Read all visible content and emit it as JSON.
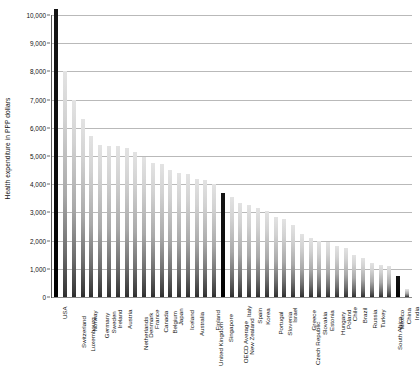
{
  "chart_data": {
    "type": "bar",
    "title": "",
    "subtitle": "",
    "xlabel": "",
    "ylabel": "Health expenditure in PPP dollars",
    "ylim": [
      0,
      10000
    ],
    "ytick_labels": [
      "10,000",
      "9,000",
      "8,000",
      "7,000",
      "6,000",
      "5,000",
      "4,000",
      "3,000",
      "2,000",
      "1,000",
      "0"
    ],
    "ytick_values": [
      10000,
      9000,
      8000,
      7000,
      6000,
      5000,
      4000,
      3000,
      2000,
      1000,
      0
    ],
    "grid": true,
    "legend": "none",
    "highlight_color": "#000000",
    "bar_color": "#b0b0b0",
    "highlighted_categories": [
      "USA",
      "OECD Average",
      "China"
    ],
    "categories": [
      "USA",
      "Switzerland",
      "Luxembourg",
      "Norway",
      "Germany",
      "Sweden",
      "Ireland",
      "Austria",
      "Netherlands",
      "Denmark",
      "France",
      "Canada",
      "Belgium",
      "Japan",
      "Iceland",
      "Australia",
      "United Kingdom",
      "Finland",
      "Singapore",
      "OECD Average",
      "New Zealand",
      "Italy",
      "Spain",
      "Korea",
      "Portugal",
      "Slovenia",
      "Israel",
      "Czech Republic",
      "Greece",
      "Slovakia",
      "Estonia",
      "Hungary",
      "Poland",
      "Chile",
      "Brazil",
      "Russia",
      "Turkey",
      "South Africa",
      "Mexico",
      "China",
      "India"
    ],
    "values": [
      10200,
      8000,
      7000,
      6300,
      5700,
      5400,
      5350,
      5350,
      5300,
      5150,
      4950,
      4750,
      4700,
      4500,
      4400,
      4350,
      4200,
      4150,
      4000,
      3700,
      3550,
      3350,
      3250,
      3150,
      3050,
      2850,
      2750,
      2550,
      2250,
      2100,
      2000,
      1950,
      1800,
      1750,
      1500,
      1400,
      1200,
      1150,
      1100,
      730,
      270
    ]
  }
}
